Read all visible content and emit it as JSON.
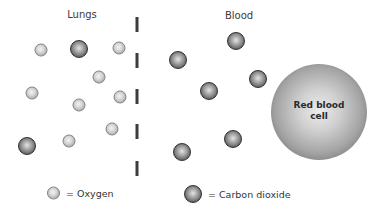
{
  "diagram": {
    "regions": {
      "left_label": "Lungs",
      "right_label": "Blood"
    },
    "labels": {
      "lungs": {
        "text": "Lungs",
        "x": 82,
        "y": 14
      },
      "blood": {
        "text": "Blood",
        "x": 239,
        "y": 15
      }
    },
    "membrane": {
      "x": 137,
      "dashes": [
        {
          "y": 17,
          "h": 15
        },
        {
          "y": 53,
          "h": 15
        },
        {
          "y": 89,
          "h": 15
        },
        {
          "y": 124,
          "h": 15
        },
        {
          "y": 161,
          "h": 15
        }
      ]
    },
    "molecules": {
      "oxygen_lungs": [
        {
          "x": 41,
          "y": 50
        },
        {
          "x": 119,
          "y": 48
        },
        {
          "x": 99,
          "y": 77
        },
        {
          "x": 32,
          "y": 93
        },
        {
          "x": 79,
          "y": 105
        },
        {
          "x": 120,
          "y": 97
        },
        {
          "x": 112,
          "y": 129
        },
        {
          "x": 69,
          "y": 141
        }
      ],
      "co2_lungs": [
        {
          "x": 79,
          "y": 49
        },
        {
          "x": 27,
          "y": 146
        }
      ],
      "co2_blood": [
        {
          "x": 236,
          "y": 41
        },
        {
          "x": 178,
          "y": 60
        },
        {
          "x": 258,
          "y": 79
        },
        {
          "x": 209,
          "y": 91
        },
        {
          "x": 233,
          "y": 139
        },
        {
          "x": 182,
          "y": 152
        }
      ]
    },
    "red_blood_cell": {
      "label": "Red blood cell",
      "x": 319,
      "y": 112,
      "diameter": 96
    },
    "legend": [
      {
        "key": "oxygen",
        "symbol": "light-sphere",
        "text": "= Oxygen",
        "x": 47,
        "y": 193
      },
      {
        "key": "co2",
        "symbol": "dark-sphere",
        "text": "= Carbon dioxide",
        "x": 184,
        "y": 194
      }
    ],
    "colors": {
      "background": "#ffffff",
      "oxygen": "#cfcfcf",
      "carbon_dioxide": "#6a6a6a",
      "red_blood_cell": "#a4a4a4",
      "membrane": "#3c3c3c",
      "text": "#333333"
    }
  }
}
